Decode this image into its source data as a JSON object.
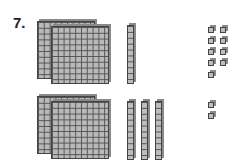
{
  "problem": {
    "number_label": "7.",
    "rows": [
      {
        "name": "top",
        "hundreds_flats": 2,
        "tens_rods": 1,
        "ones_units": 9
      },
      {
        "name": "bottom",
        "hundreds_flats": 2,
        "tens_rods": 3,
        "ones_units": 2
      }
    ]
  },
  "colors": {
    "block_fill": "#bdbdbd",
    "grid_line": "#555555",
    "edge": "#444444"
  }
}
